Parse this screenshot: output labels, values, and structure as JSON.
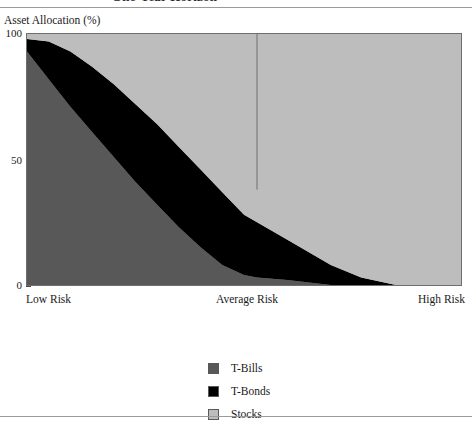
{
  "figure": {
    "running_title": "One-Year Horizon",
    "y_axis_title": "Asset Allocation (%)"
  },
  "chart_data": {
    "type": "area",
    "title": "One-Year Horizon",
    "xlabel": "",
    "ylabel": "Asset Allocation (%)",
    "ylim": [
      0,
      100
    ],
    "xlim": [
      0,
      100
    ],
    "grid": false,
    "stacked": true,
    "legend_position": "bottom-center",
    "xtick_labels": [
      "Low Risk",
      "Average Risk",
      "High Risk"
    ],
    "xtick_positions": [
      0,
      53,
      100
    ],
    "ytick_labels": [
      "0",
      "50",
      "100"
    ],
    "ytick_values": [
      0,
      50,
      100
    ],
    "x": [
      0,
      5,
      10,
      15,
      20,
      25,
      30,
      35,
      40,
      45,
      50,
      53,
      60,
      70,
      77,
      85,
      100
    ],
    "series": [
      {
        "name": "T-Bills",
        "color": "#585858",
        "values": [
          93,
          82,
          71,
          61,
          51,
          41,
          32,
          23,
          15,
          8,
          4,
          3,
          2,
          0,
          0,
          0,
          0
        ]
      },
      {
        "name": "T-Bonds",
        "color": "#000000",
        "values": [
          5,
          15,
          22,
          26,
          29,
          31,
          32,
          32,
          31,
          29,
          24,
          22,
          16,
          8,
          3,
          0,
          0
        ]
      },
      {
        "name": "Stocks",
        "color": "#bdbdbd",
        "values": [
          2,
          3,
          7,
          13,
          20,
          28,
          36,
          45,
          54,
          63,
          72,
          75,
          82,
          92,
          97,
          100,
          100
        ]
      }
    ],
    "annotations": [
      {
        "name": "average-risk-divider",
        "type": "vline",
        "x": 53,
        "y_from": 100,
        "y_to": 38,
        "color": "#6e6e6e"
      }
    ]
  },
  "legend": {
    "items": [
      {
        "label": "T-Bills",
        "color": "#585858"
      },
      {
        "label": "T-Bonds",
        "color": "#000000"
      },
      {
        "label": "Stocks",
        "color": "#bdbdbd"
      }
    ]
  }
}
